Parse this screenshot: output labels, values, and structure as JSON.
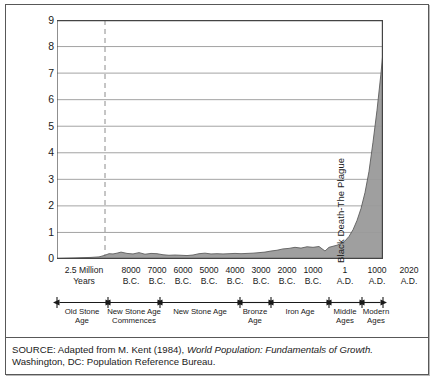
{
  "chart_data": {
    "type": "area",
    "title": "",
    "xlabel": "",
    "ylabel": "",
    "ylim": [
      0,
      9
    ],
    "yticks": [
      0,
      1,
      2,
      3,
      4,
      5,
      6,
      7,
      8,
      9
    ],
    "grid": true,
    "legend": "none",
    "xtick_labels": [
      {
        "line1": "2.5 Million",
        "line2": "Years"
      },
      {
        "line1": "8000",
        "line2": "B.C."
      },
      {
        "line1": "7000",
        "line2": "B.C."
      },
      {
        "line1": "6000",
        "line2": "B.C."
      },
      {
        "line1": "5000",
        "line2": "B.C."
      },
      {
        "line1": "4000",
        "line2": "B.C."
      },
      {
        "line1": "3000",
        "line2": "B.C."
      },
      {
        "line1": "2000",
        "line2": "B.C."
      },
      {
        "line1": "1000",
        "line2": "B.C."
      },
      {
        "line1": "1",
        "line2": "A.D."
      },
      {
        "line1": "1000",
        "line2": "A.D."
      },
      {
        "line1": "2020",
        "line2": "A.D."
      }
    ],
    "series": [
      {
        "name": "World population (billions)",
        "x": [
          0,
          10,
          18,
          26,
          34,
          42,
          48,
          52,
          56,
          60,
          64,
          70,
          76,
          82,
          88,
          94,
          100,
          106,
          112,
          118,
          124,
          130,
          136,
          142,
          148,
          154,
          160,
          166,
          172,
          178,
          184,
          190,
          196,
          202,
          208,
          214,
          220,
          226,
          232,
          238,
          244,
          250,
          256,
          262,
          268,
          272,
          276,
          280,
          284,
          288,
          292,
          296,
          300,
          304,
          308,
          312,
          316,
          320,
          324,
          326
        ],
        "values": [
          0.02,
          0.03,
          0.04,
          0.05,
          0.06,
          0.08,
          0.14,
          0.2,
          0.19,
          0.22,
          0.26,
          0.21,
          0.19,
          0.24,
          0.18,
          0.21,
          0.2,
          0.16,
          0.14,
          0.15,
          0.14,
          0.13,
          0.15,
          0.2,
          0.22,
          0.19,
          0.2,
          0.19,
          0.2,
          0.21,
          0.2,
          0.21,
          0.22,
          0.24,
          0.26,
          0.3,
          0.33,
          0.38,
          0.4,
          0.44,
          0.41,
          0.46,
          0.44,
          0.47,
          0.3,
          0.44,
          0.48,
          0.52,
          0.58,
          0.68,
          0.85,
          1.1,
          1.45,
          1.9,
          2.5,
          3.3,
          4.4,
          5.6,
          7.0,
          7.8
        ]
      }
    ],
    "annotations": [
      {
        "text": "Black Death-The Plague",
        "orientation": "vertical"
      }
    ],
    "reference_lines": [
      {
        "label": "8000 B.C.",
        "style": "dashed",
        "orientation": "vertical"
      }
    ],
    "eras": [
      {
        "label_line1": "Old Stone",
        "label_line2": "Age"
      },
      {
        "label_line1": "New Stone Age",
        "label_line2": "Commences"
      },
      {
        "label_line1": "New Stone Age",
        "label_line2": ""
      },
      {
        "label_line1": "Bronze",
        "label_line2": "Age"
      },
      {
        "label_line1": "Iron Age",
        "label_line2": ""
      },
      {
        "label_line1": "Middle",
        "label_line2": "Ages"
      },
      {
        "label_line1": "Modern",
        "label_line2": "Ages"
      }
    ]
  },
  "source": {
    "prefix": "SOURCE: Adapted from M. Kent (1984),",
    "italic_title": "World Population: Fundamentals of Growth.",
    "suffix": "Washington, DC: Population Reference Bureau."
  },
  "colors": {
    "area_fill": "#9a9a9a",
    "area_stroke": "#5d5d5d",
    "grid": "#8c8c8c",
    "axis": "#444444",
    "frame": "#585858",
    "text": "#1a1a1a"
  }
}
